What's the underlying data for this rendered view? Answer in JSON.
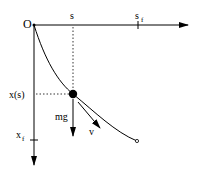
{
  "diagram": {
    "labels": {
      "origin": "O",
      "s": "s",
      "s_f": "s",
      "s_f_sub": "f",
      "x_s": "x(s)",
      "x_f": "x",
      "x_f_sub": "f",
      "mg": "mg",
      "v": "v"
    },
    "colors": {
      "stroke": "#000000",
      "background": "#ffffff"
    }
  }
}
